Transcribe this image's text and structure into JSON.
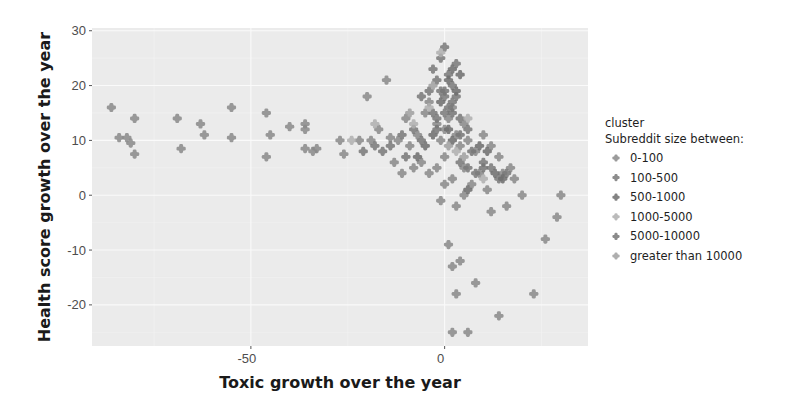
{
  "chart_data": {
    "type": "scatter",
    "title": "",
    "xlabel": "Toxic growth over the year",
    "ylabel": "Health score growth over the year",
    "xlim": [
      -91,
      37
    ],
    "ylim": [
      -27.5,
      30.5
    ],
    "x_ticks": [
      -50,
      0
    ],
    "y_ticks": [
      30,
      20,
      10,
      0,
      -10,
      -20
    ],
    "grid": true,
    "legend_position": "right",
    "legend": {
      "title_line1": "cluster",
      "title_line2": "Subreddit size between:",
      "entries": [
        "0-100",
        "100-500",
        "500-1000",
        "1000-5000",
        "5000-10000",
        "greater than 10000"
      ]
    },
    "series": [
      {
        "name": "0-100",
        "color": "#8a8a8a",
        "points": [
          [
            -86,
            16
          ],
          [
            -84,
            10.5
          ],
          [
            -82,
            10.5
          ],
          [
            -81,
            9.5
          ],
          [
            -80,
            7.5
          ],
          [
            -80,
            14
          ],
          [
            -69,
            14
          ],
          [
            -68,
            8.5
          ],
          [
            -63,
            13
          ],
          [
            -62,
            11
          ],
          [
            -55,
            10.5
          ],
          [
            -55,
            16
          ],
          [
            -46,
            15
          ],
          [
            -45,
            11
          ],
          [
            -46,
            7
          ],
          [
            -40,
            12.5
          ],
          [
            -36,
            12
          ],
          [
            -36,
            13
          ],
          [
            -36,
            8.5
          ],
          [
            -34,
            8
          ],
          [
            -33,
            8.5
          ],
          [
            -27,
            10
          ],
          [
            -26,
            7.5
          ],
          [
            -22,
            10
          ],
          [
            -19,
            10
          ],
          [
            -17,
            12
          ],
          [
            -14,
            10.5
          ],
          [
            -12,
            10
          ],
          [
            -9,
            9
          ],
          [
            -7,
            11
          ],
          [
            -20,
            18
          ],
          [
            -15,
            21
          ],
          [
            -10,
            14
          ],
          [
            -5,
            15
          ],
          [
            -4,
            17
          ],
          [
            -2,
            13
          ],
          [
            -1,
            10
          ],
          [
            0,
            12
          ],
          [
            1,
            14
          ],
          [
            2,
            16
          ],
          [
            3,
            11
          ],
          [
            4,
            9
          ],
          [
            5,
            13
          ],
          [
            6,
            10
          ],
          [
            8,
            8
          ],
          [
            10,
            11
          ],
          [
            12,
            9
          ],
          [
            14,
            7
          ],
          [
            15,
            4
          ],
          [
            17,
            5
          ],
          [
            18,
            3
          ],
          [
            -6,
            6
          ],
          [
            -4,
            4
          ],
          [
            -2,
            5
          ],
          [
            0,
            7
          ],
          [
            2,
            3
          ],
          [
            5,
            5
          ],
          [
            7,
            2
          ],
          [
            9,
            4
          ],
          [
            11,
            1
          ],
          [
            0,
            2
          ],
          [
            -1,
            -1
          ],
          [
            3,
            -2
          ],
          [
            5,
            0
          ],
          [
            -8,
            5
          ],
          [
            -11,
            4
          ],
          [
            -13,
            6
          ],
          [
            20,
            0
          ],
          [
            16,
            -2
          ],
          [
            12,
            -3
          ],
          [
            1,
            -9
          ],
          [
            2,
            -13
          ],
          [
            4,
            -12
          ],
          [
            3,
            -18
          ],
          [
            8,
            -16
          ],
          [
            14,
            -22
          ],
          [
            2,
            -25
          ],
          [
            6,
            -25
          ],
          [
            26,
            -8
          ],
          [
            29,
            -4
          ],
          [
            30,
            0
          ],
          [
            23,
            -18
          ]
        ]
      },
      {
        "name": "100-500",
        "color": "#7a7a7a",
        "points": [
          [
            -3,
            23
          ],
          [
            -2,
            21
          ],
          [
            -1,
            25
          ],
          [
            0,
            27
          ],
          [
            1,
            22
          ],
          [
            2,
            20
          ],
          [
            3,
            24
          ],
          [
            -1,
            19
          ],
          [
            0,
            18
          ],
          [
            1,
            16
          ],
          [
            2,
            17
          ],
          [
            3,
            18
          ],
          [
            -4,
            19
          ],
          [
            -6,
            18
          ],
          [
            -3,
            15
          ],
          [
            -2,
            14
          ],
          [
            0,
            15
          ],
          [
            4,
            14
          ],
          [
            6,
            12
          ],
          [
            -8,
            12
          ],
          [
            -11,
            11
          ],
          [
            -14,
            9
          ],
          [
            -16,
            8
          ],
          [
            -18,
            9
          ],
          [
            -21,
            8
          ],
          [
            4,
            6
          ],
          [
            6,
            5
          ],
          [
            8,
            4
          ],
          [
            10,
            6
          ],
          [
            12,
            5
          ],
          [
            14,
            3
          ],
          [
            16,
            4
          ]
        ]
      },
      {
        "name": "500-1000",
        "color": "#6e6e6e",
        "points": [
          [
            1,
            21
          ],
          [
            2,
            23
          ],
          [
            3,
            19
          ],
          [
            4,
            22
          ],
          [
            -1,
            17
          ],
          [
            1,
            12
          ],
          [
            2,
            10
          ],
          [
            -3,
            11
          ],
          [
            -5,
            9
          ],
          [
            -7,
            7
          ],
          [
            9,
            9
          ],
          [
            11,
            8
          ],
          [
            13,
            4
          ],
          [
            15,
            3
          ],
          [
            6,
            1
          ]
        ]
      },
      {
        "name": "1000-5000",
        "color": "#b0b0b0",
        "points": [
          [
            -1,
            26
          ],
          [
            -4,
            16
          ],
          [
            6,
            14
          ],
          [
            -24,
            10
          ],
          [
            -18,
            13
          ],
          [
            -8,
            13
          ],
          [
            3,
            8
          ],
          [
            10,
            3
          ]
        ]
      },
      {
        "name": "5000-10000",
        "color": "#777777",
        "points": [
          [
            0,
            19
          ],
          [
            2,
            15
          ],
          [
            -2,
            12
          ],
          [
            4,
            11
          ],
          [
            -6,
            10
          ],
          [
            7,
            8
          ],
          [
            -10,
            7
          ],
          [
            10,
            5
          ]
        ]
      },
      {
        "name": "greater than 10000",
        "color": "#a0a0a0",
        "points": [
          [
            -3,
            20
          ],
          [
            1,
            9
          ],
          [
            -9,
            15
          ],
          [
            5,
            7
          ]
        ]
      }
    ]
  }
}
